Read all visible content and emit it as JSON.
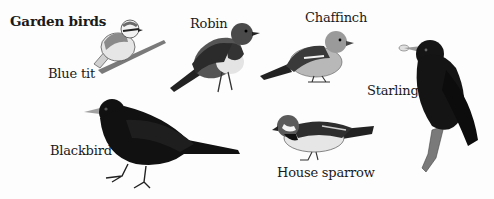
{
  "title": "Garden birds",
  "birds": [
    {
      "name": "Blue tit"
    },
    {
      "name": "Robin"
    },
    {
      "name": "Chaffinch"
    },
    {
      "name": "Starling"
    },
    {
      "name": "Blackbird"
    },
    {
      "name": "House sparrow"
    }
  ],
  "colors": {
    "ink": "#1a1a1a",
    "black_plumage": "#111111",
    "robin_breast": "#3a3a3a",
    "pale_belly": "#e8e8e8",
    "grey_mid": "#8a8a8a",
    "chaffinch_breast": "#b5b5b5",
    "branch": "#6b6b6b"
  }
}
